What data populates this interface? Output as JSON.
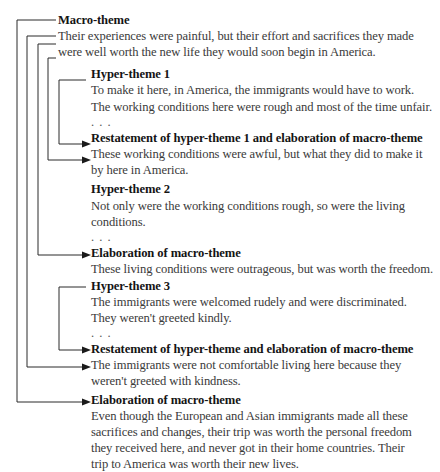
{
  "diagram": {
    "macro_theme": {
      "heading": "Macro-theme",
      "lines": [
        "Their experiences were painful, but their effort and sacrifices they made",
        "were well worth the new life they would soon begin in America."
      ]
    },
    "hyper_theme_1": {
      "heading": "Hyper-theme 1",
      "lines": [
        "To make it here, in America, the immigrants would have to work.",
        "The working conditions here were rough and most of the time unfair."
      ],
      "ellipsis": ". . ."
    },
    "restatement_1": {
      "heading": "Restatement of hyper-theme 1 and elaboration of macro-theme",
      "lines": [
        "These working conditions were awful, but what they did to make it",
        "by here in America."
      ]
    },
    "hyper_theme_2": {
      "heading": "Hyper-theme 2",
      "lines": [
        "Not only were the working conditions rough, so were the living",
        "conditions."
      ],
      "ellipsis": ". . ."
    },
    "elaboration_1": {
      "heading": "Elaboration of macro-theme",
      "lines": [
        "These living conditions were outrageous, but was worth the freedom."
      ]
    },
    "hyper_theme_3": {
      "heading": "Hyper-theme 3",
      "lines": [
        "The immigrants were welcomed rudely and were discriminated.",
        "They weren't greeted kindly."
      ],
      "ellipsis": ". . ."
    },
    "restatement_2": {
      "heading": "Restatement of hyper-theme and elaboration of macro-theme",
      "lines": [
        "The immigrants were not comfortable living here because they",
        "weren't greeted with kindness."
      ]
    },
    "elaboration_2": {
      "heading": "Elaboration of macro-theme",
      "lines": [
        "Even though the European and Asian immigrants made all these",
        "sacrifices and changes, their trip was worth the personal freedom",
        "they received here, and never got in their home countries. Their",
        "trip to America was worth their new lives."
      ]
    }
  }
}
